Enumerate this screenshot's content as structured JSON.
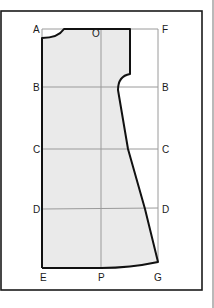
{
  "diagram": {
    "type": "sewing-pattern-draft",
    "colors": {
      "frame": "#1a1a1a",
      "grid": "#9a9a9a",
      "fill": "#eaeaea",
      "outline": "#111111",
      "right_edge": "#8a8a8a"
    },
    "labels": {
      "A": "A",
      "O": "O",
      "F": "F",
      "B_left": "B",
      "B_right": "B",
      "C_left": "C",
      "C_right": "C",
      "D_left": "D",
      "D_right": "D",
      "E": "E",
      "P": "P",
      "G": "G"
    },
    "grid_lines": {
      "vertical": [
        "A-E",
        "O-P",
        "F-G"
      ],
      "horizontal": [
        "A-F",
        "B-B",
        "C-C",
        "D-D",
        "E-G"
      ]
    }
  }
}
